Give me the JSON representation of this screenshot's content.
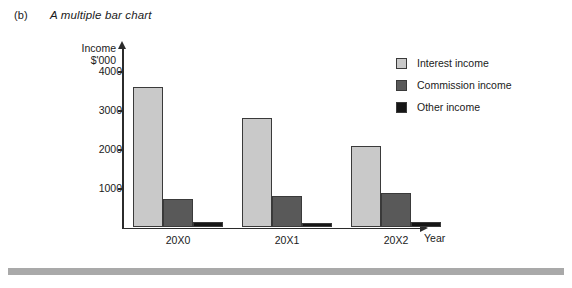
{
  "caption": {
    "label": "(b)",
    "title": "A multiple bar chart"
  },
  "chart_data": {
    "type": "bar",
    "title": "A multiple bar chart",
    "xlabel": "Year",
    "ylabel": "Income $'000",
    "ylabel_line1": "Income",
    "ylabel_line2": "$'000",
    "categories": [
      "20X0",
      "20X1",
      "20X2"
    ],
    "series": [
      {
        "name": "Interest income",
        "values": [
          3600,
          2800,
          2080
        ],
        "color": "#c9c9c9"
      },
      {
        "name": "Commission income",
        "values": [
          740,
          820,
          880
        ],
        "color": "#595959"
      },
      {
        "name": "Other income",
        "values": [
          130,
          110,
          150
        ],
        "color": "#161616"
      }
    ],
    "yticks": [
      1000,
      2000,
      3000,
      4000
    ],
    "ytick_labels": [
      "1000",
      "2000",
      "3000",
      "4000"
    ],
    "ylim": [
      0,
      4600
    ],
    "grid": false,
    "legend_position": "top-right",
    "axis_arrows": true
  },
  "legend": {
    "entries": [
      {
        "label": "Interest income"
      },
      {
        "label": "Commission income"
      },
      {
        "label": "Other income"
      }
    ]
  }
}
